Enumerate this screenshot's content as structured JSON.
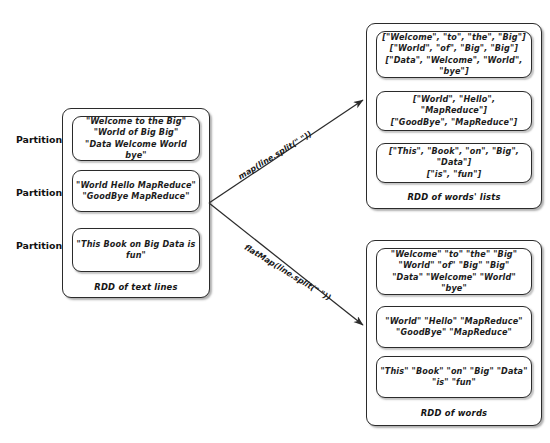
{
  "diagram": {
    "partition_labels": [
      "Partition 0",
      "Partition 1",
      "Partition 2"
    ],
    "source_rdd": {
      "caption": "RDD of text lines",
      "partitions": [
        "\"Welcome to the Big\"\n\"World of Big Big\"\n\"Data Welcome World bye\"",
        "\"World Hello MapReduce\"\n\"GoodBye MapReduce\"",
        "\"This Book on Big Data is fun\""
      ]
    },
    "map_rdd": {
      "caption": "RDD of words' lists",
      "partitions": [
        "[\"Welcome\", \"to\", \"the\", \"Big\"]\n[\"World\", \"of\", \"Big\", \"Big\"]\n[\"Data\", \"Welcome\", \"World\", \"bye\"]",
        "[\"World\", \"Hello\", \"MapReduce\"]\n[\"GoodBye\", \"MapReduce\"]",
        "[\"This\", \"Book\", \"on\", \"Big\", \"Data\"]\n[\"is\", \"fun\"]"
      ]
    },
    "flatmap_rdd": {
      "caption": "RDD of words",
      "partitions": [
        "\"Welcome\" \"to\" \"the\" \"Big\"\n\"World\" \"of\" \"Big\" \"Big\"\n\"Data\" \"Welcome\" \"World\" \"bye\"",
        "\"World\" \"Hello\" \"MapReduce\"\n\"GoodBye\" \"MapReduce\"",
        "\"This\" \"Book\" \"on\" \"Big\" \"Data\" \"is\" \"fun\""
      ]
    },
    "arrows": [
      {
        "label": "map(line.split(\" \"))"
      },
      {
        "label": "flatMap(line.split(\" \"))"
      }
    ],
    "colors": {
      "stroke": "#2b2b2b",
      "text": "#1c1c1c",
      "background": "#ffffff"
    }
  }
}
